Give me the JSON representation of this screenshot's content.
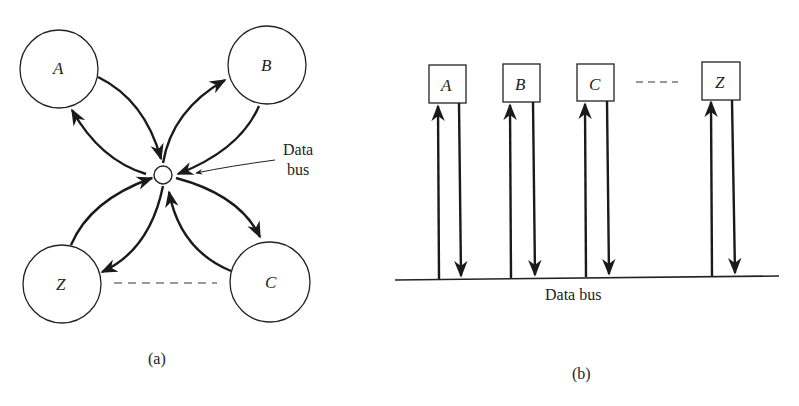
{
  "panel_a": {
    "caption": "(a)",
    "nodes": [
      {
        "id": "A",
        "label": "A"
      },
      {
        "id": "B",
        "label": "B"
      },
      {
        "id": "Z",
        "label": "Z"
      },
      {
        "id": "C",
        "label": "C"
      }
    ],
    "hub_label_line1": "Data",
    "hub_label_line2": "bus"
  },
  "panel_b": {
    "caption": "(b)",
    "nodes": [
      {
        "id": "A",
        "label": "A"
      },
      {
        "id": "B",
        "label": "B"
      },
      {
        "id": "C",
        "label": "C"
      },
      {
        "id": "Z",
        "label": "Z"
      }
    ],
    "bus_label": "Data bus"
  },
  "colors": {
    "ink": "#1a1a1a",
    "background": "#ffffff"
  }
}
